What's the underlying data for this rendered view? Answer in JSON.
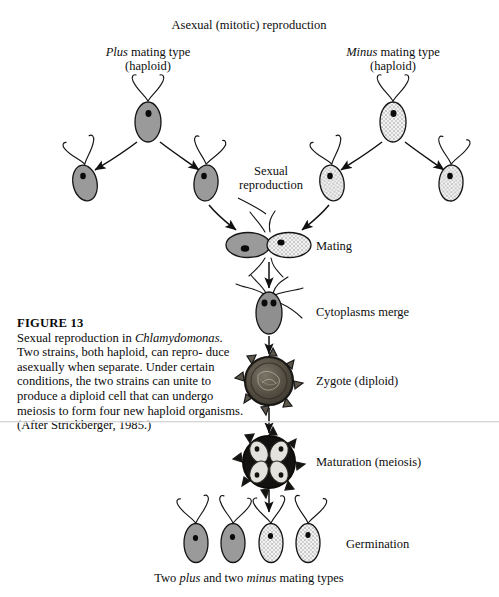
{
  "figure": {
    "number": "FIGURE 13",
    "caption_text": "Sexual reproduction in Chlamydomonas. Two strains, both haploid, can reproduce asexually when separate. Under certain conditions, the two strains can unite to produce a diploid cell that can undergo meiosis to form four new haploid organisms. (After Strickberger, 1985.)",
    "caption_parts": {
      "p1": "Sexual reproduction in ",
      "organism": "Chlamydomonas",
      "p2": ". Two strains, both haploid, can repro-",
      "p3": "duce asexually when separate. Under",
      "p4": "certain conditions, the two strains can",
      "p5": "unite to produce a diploid cell that can",
      "p6": "undergo meiosis to form four new",
      "p7": "haploid organisms. (After Strickberger,",
      "p8": "1985.)"
    }
  },
  "labels": {
    "top_title": "Asexual (mitotic) reproduction",
    "plus_type_line1_italic": "Plus",
    "plus_type_line1_rest": " mating type",
    "plus_type_line2": "(haploid)",
    "minus_type_line1_italic": "Minus",
    "minus_type_line1_rest": " mating type",
    "minus_type_line2": "(haploid)",
    "sexual_line1": "Sexual",
    "sexual_line2": "reproduction",
    "mating": "Mating",
    "cytoplasms_merge": "Cytoplasms  merge",
    "zygote": "Zygote (diploid)",
    "maturation": "Maturation (meiosis)",
    "germination": "Germination",
    "bottom_pre": "Two ",
    "bottom_plus": "plus",
    "bottom_mid": " and two ",
    "bottom_minus": "minus",
    "bottom_post": " mating types"
  },
  "colors": {
    "ink": "#111111",
    "cell_dark": "#9a9a9a",
    "cell_light": "#dcdcdc",
    "cell_outline": "#1a1a1a",
    "eyespot": "#0a0a0a",
    "zygote_fill": "#4a4742",
    "meiosis_fill": "#141414",
    "page": "#ffffff"
  },
  "diagram": {
    "type": "life-cycle-diagram",
    "organism": "Chlamydomonas",
    "cells": [
      {
        "name": "plus-parent",
        "x": 148,
        "y": 122,
        "tone": "dark",
        "rx": 13,
        "ry": 20
      },
      {
        "name": "plus-daughter-left",
        "x": 85,
        "y": 183,
        "tone": "dark",
        "rx": 12,
        "ry": 18
      },
      {
        "name": "plus-daughter-right",
        "x": 206,
        "y": 183,
        "tone": "dark",
        "rx": 12,
        "ry": 18
      },
      {
        "name": "minus-parent",
        "x": 393,
        "y": 122,
        "tone": "light",
        "rx": 13,
        "ry": 20
      },
      {
        "name": "minus-daughter-left",
        "x": 332,
        "y": 183,
        "tone": "light",
        "rx": 12,
        "ry": 18
      },
      {
        "name": "minus-daughter-right",
        "x": 451,
        "y": 183,
        "tone": "light",
        "rx": 12,
        "ry": 18
      },
      {
        "name": "mating-pair-left",
        "x": 248,
        "y": 245,
        "tone": "dark",
        "rx": 22,
        "ry": 13
      },
      {
        "name": "mating-pair-right",
        "x": 289,
        "y": 245,
        "tone": "light",
        "rx": 22,
        "ry": 13
      },
      {
        "name": "fused-cell",
        "x": 269,
        "y": 313,
        "tone": "dark",
        "rx": 13,
        "ry": 20
      },
      {
        "name": "germ-cell-1",
        "x": 196,
        "y": 543,
        "tone": "dark",
        "rx": 12,
        "ry": 19
      },
      {
        "name": "germ-cell-2",
        "x": 233,
        "y": 543,
        "tone": "dark",
        "rx": 12,
        "ry": 19
      },
      {
        "name": "germ-cell-3",
        "x": 271,
        "y": 543,
        "tone": "light",
        "rx": 12,
        "ry": 19
      },
      {
        "name": "germ-cell-4",
        "x": 308,
        "y": 543,
        "tone": "light",
        "rx": 12,
        "ry": 19
      }
    ],
    "zygote": {
      "x": 269,
      "y": 381,
      "r": 24
    },
    "meiosis": {
      "x": 269,
      "y": 462,
      "r": 26,
      "daughter_count": 4
    }
  }
}
